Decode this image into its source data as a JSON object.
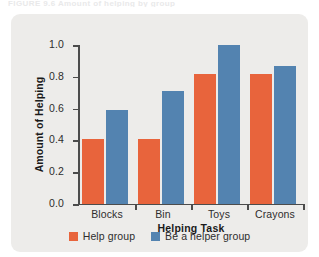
{
  "figure": {
    "panel_background": "#edecea",
    "page_background": "#ffffff",
    "caption_sliver": "FIGURE 9.6  Amount of helping by group"
  },
  "chart_data": {
    "type": "bar",
    "title": "",
    "subtitle": "",
    "xlabel": "Helping Task",
    "ylabel": "Amount of Helping",
    "categories": [
      "Blocks",
      "Bin",
      "Toys",
      "Crayons"
    ],
    "series": [
      {
        "name": "Help group",
        "color": "#e8643c",
        "values": [
          0.41,
          0.41,
          0.82,
          0.82
        ]
      },
      {
        "name": "Be a helper group",
        "color": "#5383b0",
        "values": [
          0.59,
          0.71,
          1.0,
          0.87
        ]
      }
    ],
    "ylim": [
      0.0,
      1.0
    ],
    "ytick_labels": [
      "0.0",
      "0.2",
      "0.4",
      "0.6",
      "0.8",
      "1.0"
    ],
    "ytick_values": [
      0.0,
      0.2,
      0.4,
      0.6,
      0.8,
      1.0
    ],
    "grid": false,
    "legend_position": "bottom"
  }
}
